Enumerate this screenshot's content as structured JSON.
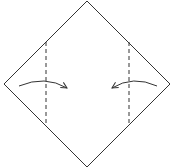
{
  "diagram": {
    "type": "origami-fold-step",
    "paper": {
      "shape": "square-rotated-45",
      "vertices": {
        "top": [
          87,
          1
        ],
        "right": [
          170,
          84
        ],
        "bottom": [
          87,
          167
        ],
        "left": [
          4,
          84
        ]
      },
      "stroke_color": "#333333"
    },
    "fold_lines": [
      {
        "name": "left-valley-fold",
        "style": "dashed",
        "x": 46,
        "y1": 42,
        "y2": 126
      },
      {
        "name": "right-valley-fold",
        "style": "dashed",
        "x": 129,
        "y1": 42,
        "y2": 126
      }
    ],
    "arrows": [
      {
        "name": "left-fold-arrow",
        "direction": "right",
        "from": [
          19,
          86
        ],
        "to": [
          67,
          88
        ]
      },
      {
        "name": "right-fold-arrow",
        "direction": "left",
        "from": [
          157,
          86
        ],
        "to": [
          112,
          88
        ]
      }
    ],
    "colors": {
      "line": "#333333",
      "background": "#ffffff"
    }
  }
}
